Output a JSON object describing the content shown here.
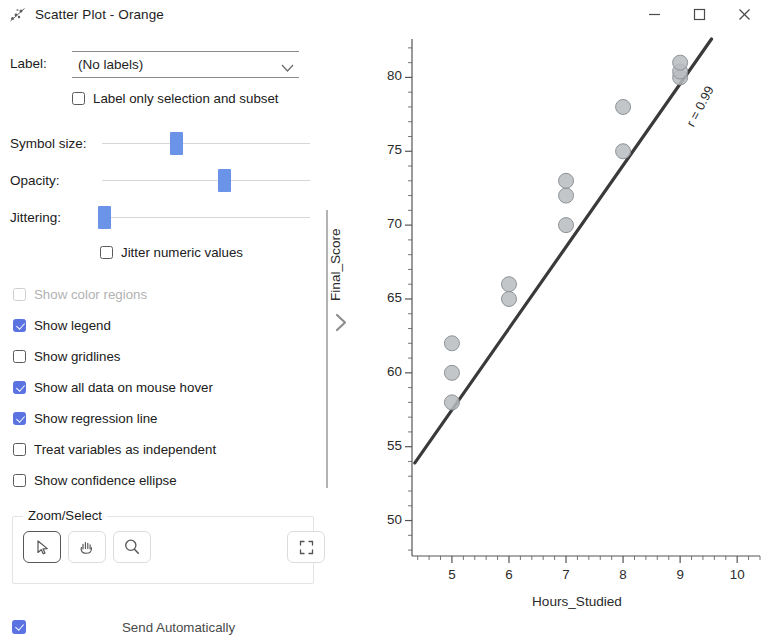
{
  "window": {
    "title": "Scatter Plot - Orange",
    "app_icon": "scatter-plot-icon",
    "minimize_label": "—",
    "maximize_label": "□",
    "close_label": "✕"
  },
  "controls": {
    "label_field": {
      "label": "Label:",
      "value": "(No labels)",
      "placeholder": "(No labels)"
    },
    "label_only_checkbox": {
      "label": "Label only selection and subset",
      "checked": false
    },
    "sliders": [
      {
        "label": "Symbol size:",
        "handle_pct": 33
      },
      {
        "label": "Opacity:",
        "handle_pct": 56
      },
      {
        "label": "Jittering:",
        "handle_pct": 0
      }
    ],
    "jitter_checkbox": {
      "label": "Jitter numeric values",
      "checked": false
    },
    "options": [
      {
        "label": "Show color regions",
        "checked": false,
        "disabled": true
      },
      {
        "label": "Show legend",
        "checked": true,
        "disabled": false
      },
      {
        "label": "Show gridlines",
        "checked": false,
        "disabled": false
      },
      {
        "label": "Show all data on mouse hover",
        "checked": true,
        "disabled": false
      },
      {
        "label": "Show regression line",
        "checked": true,
        "disabled": false
      },
      {
        "label": "Treat variables as independent",
        "checked": false,
        "disabled": false
      },
      {
        "label": "Show confidence ellipse",
        "checked": false,
        "disabled": false
      }
    ],
    "zoom_select": {
      "title": "Zoom/Select",
      "tools": [
        {
          "name": "select-arrow",
          "active": true
        },
        {
          "name": "pan-hand",
          "active": false
        },
        {
          "name": "zoom-magnifier",
          "active": false
        }
      ],
      "reset_button": {
        "name": "reset-zoom",
        "active": false
      }
    },
    "send_automatically": {
      "label": "Send Automatically",
      "checked": true
    }
  },
  "statusbar": {
    "text": "201 | 1 | 201 2",
    "icons": [
      "menu-icon",
      "cloud-icon",
      "report-icon",
      "save-icon",
      "edit-icon"
    ]
  },
  "chart_data": {
    "type": "scatter",
    "title": "",
    "xlabel": "Hours_Studied",
    "ylabel": "Final_Score",
    "xlim": [
      4.3,
      10.4
    ],
    "ylim": [
      47.6,
      82.6
    ],
    "xticks": [
      5,
      6,
      7,
      8,
      9,
      10
    ],
    "yticks": [
      50,
      55,
      60,
      65,
      70,
      75,
      80
    ],
    "grid": false,
    "legend": false,
    "point_color": "#b9bcc0",
    "point_edge_color": "#8e9398",
    "point_radius": 7.5,
    "points": [
      {
        "x": 5,
        "y": 58
      },
      {
        "x": 5,
        "y": 60
      },
      {
        "x": 5,
        "y": 62
      },
      {
        "x": 6,
        "y": 65
      },
      {
        "x": 6,
        "y": 66
      },
      {
        "x": 7,
        "y": 70
      },
      {
        "x": 7,
        "y": 72
      },
      {
        "x": 7,
        "y": 73
      },
      {
        "x": 8,
        "y": 75
      },
      {
        "x": 8,
        "y": 78
      },
      {
        "x": 9,
        "y": 80
      },
      {
        "x": 9,
        "y": 80.4
      },
      {
        "x": 9,
        "y": 81
      }
    ],
    "regression_line": {
      "color": "#3a3a3a",
      "width": 3.2,
      "x0": 4.35,
      "y0": 53.9,
      "x1": 9.55,
      "y1": 82.6
    },
    "annotation": {
      "text": "r = 0.99",
      "x": 9.05,
      "y": 77.0,
      "rotation": -62
    }
  }
}
